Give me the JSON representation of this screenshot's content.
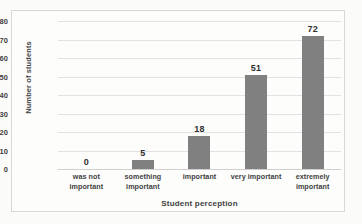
{
  "chart_data": {
    "type": "bar",
    "title": "",
    "subtitle": "",
    "categories": [
      "was not important",
      "something important",
      "important",
      "very important",
      "extremely important"
    ],
    "values": [
      0,
      5,
      18,
      51,
      72
    ],
    "data_labels": [
      "0",
      "5",
      "18",
      "51",
      "72"
    ],
    "xlabel": "Student perception",
    "ylabel": "Number of students",
    "ylim": [
      0,
      80
    ],
    "ytick_step": 10,
    "ytick_labels": [
      "80",
      "70",
      "60",
      "50",
      "40",
      "30",
      "20",
      "10",
      "0"
    ],
    "ytick_values": [
      80,
      70,
      60,
      50,
      40,
      30,
      20,
      10,
      0
    ],
    "grid": "horizontal",
    "legend": "none",
    "bar_color": "#808080",
    "gridline_color": "#e2e2e2",
    "axis_text_color": "#3f3f3f",
    "plot_background": "#fdfdfc",
    "border_color": "#d8d8d8"
  }
}
